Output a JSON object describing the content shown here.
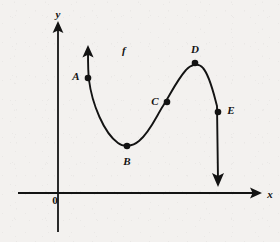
{
  "figure": {
    "background_color": "#f3f1ef",
    "stroke_color": "#131313",
    "axes": {
      "y_axis_label": "y",
      "x_axis_label": "x",
      "origin_label": "0"
    },
    "curve": {
      "function_label": "f",
      "stroke_color": "#131313"
    },
    "points": [
      {
        "id": "A",
        "label": "A",
        "x": 88,
        "y": 78,
        "label_x": 76,
        "label_y": 76,
        "role": "on-descending-branch"
      },
      {
        "id": "B",
        "label": "B",
        "x": 127,
        "y": 146,
        "label_x": 127,
        "label_y": 161,
        "role": "local-minimum"
      },
      {
        "id": "C",
        "label": "C",
        "x": 167,
        "y": 102,
        "label_x": 155,
        "label_y": 101,
        "role": "inflection-point"
      },
      {
        "id": "D",
        "label": "D",
        "x": 195,
        "y": 63,
        "label_x": 195,
        "label_y": 49,
        "role": "local-maximum"
      },
      {
        "id": "E",
        "label": "E",
        "x": 218,
        "y": 112,
        "label_x": 231,
        "label_y": 110,
        "role": "on-descending-branch"
      }
    ]
  }
}
